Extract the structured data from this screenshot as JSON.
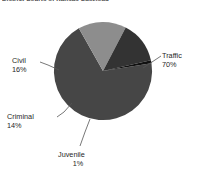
{
  "chart_title": "District Courts of Kansas Caseload",
  "colors": {
    "traffic": "#464646",
    "civil": "#8d8d8d",
    "criminal": "#333333",
    "juvenile": "#111111",
    "background": "#ffffff",
    "leader_line": "#555555",
    "label_text": "#1f1f1f"
  },
  "labels": {
    "traffic": {
      "name": "Traffic",
      "pct": "70%"
    },
    "civil": {
      "name": "Civil",
      "pct": "16%"
    },
    "criminal": {
      "name": "Criminal",
      "pct": "14%"
    },
    "juvenile": {
      "name": "Juvenile",
      "pct": "1%"
    }
  },
  "chart_data": {
    "type": "pie",
    "title": "District Courts of Kansas Caseload",
    "categories": [
      "Traffic",
      "Civil",
      "Criminal",
      "Juvenile"
    ],
    "values": [
      70,
      16,
      14,
      1
    ],
    "value_labels": [
      "70%",
      "16%",
      "14%",
      "1%"
    ],
    "units": "percent",
    "legend": "none",
    "labels_position": "outside-with-leader-lines",
    "colors": [
      "#464646",
      "#8d8d8d",
      "#333333",
      "#111111"
    ],
    "start_angle_deg": -9,
    "direction": "clockwise",
    "grid": false,
    "xlabel": "",
    "ylabel": ""
  }
}
